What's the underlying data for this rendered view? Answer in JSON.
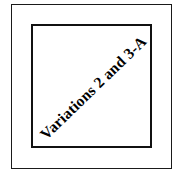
{
  "figure": {
    "kind": "nested-rectangle-diagram",
    "background_color": "#ffffff",
    "line_color": "#111111",
    "outer_frame": {
      "label": "outer border rectangle",
      "stroke_width_px": 1
    },
    "inner_frame": {
      "label": "inner border rectangle",
      "stroke_width_px": 2
    },
    "diagonal_label": {
      "text": "Variations 2 and 3-A",
      "rotation_deg": -44,
      "weight": "bold",
      "color": "#000000"
    }
  }
}
